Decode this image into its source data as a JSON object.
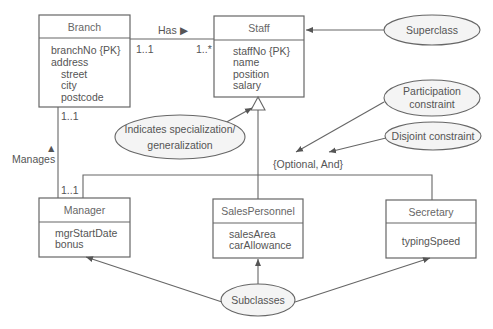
{
  "diagram": {
    "type": "UML class diagram (EER specialization/generalization)",
    "classes": {
      "branch": {
        "name": "Branch",
        "attributes": [
          "branchNo {PK}",
          "address",
          "street",
          "city",
          "postcode"
        ]
      },
      "staff": {
        "name": "Staff",
        "attributes": [
          "staffNo {PK}",
          "name",
          "position",
          "salary"
        ]
      },
      "manager": {
        "name": "Manager",
        "attributes": [
          "mgrStartDate",
          "bonus"
        ]
      },
      "salesPersonnel": {
        "name": "SalesPersonnel",
        "attributes": [
          "salesArea",
          "carAllowance"
        ]
      },
      "secretary": {
        "name": "Secretary",
        "attributes": [
          "typingSpeed"
        ]
      }
    },
    "relationships": {
      "has": {
        "label": "Has",
        "arrow": "▶",
        "from_multiplicity": "1..1",
        "to_multiplicity": "1..*"
      },
      "manages": {
        "label": "Manages",
        "arrow": "▲",
        "top_multiplicity": "1..1",
        "bottom_multiplicity": "1..1"
      }
    },
    "constraint": "{Optional, And}",
    "annotations": {
      "superclass": "Superclass",
      "participation_line1": "Participation",
      "participation_line2": "constraint",
      "disjoint": "Disjoint constraint",
      "specialization_line1": "Indicates specialization/",
      "specialization_line2": "generalization",
      "subclasses": "Subclasses"
    },
    "colors": {
      "line": "#666666",
      "text": "#555555",
      "ellipse_fill": "#f4f4f4"
    }
  }
}
